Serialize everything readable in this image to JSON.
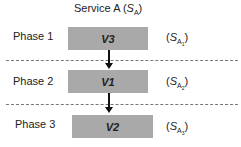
{
  "title": {
    "prefix": "Service A (",
    "symbol": "S",
    "sub": "A",
    "suffix": ")"
  },
  "phases": [
    {
      "label": "Phase 1",
      "version": "V3",
      "state": {
        "symbol": "S",
        "sub": "A",
        "subsub": "1"
      }
    },
    {
      "label": "Phase 2",
      "version": "V1",
      "state": {
        "symbol": "S",
        "sub": "A",
        "subsub": "2"
      }
    },
    {
      "label": "Phase 3",
      "version": "V2",
      "state": {
        "symbol": "S",
        "sub": "A",
        "subsub": "3"
      }
    }
  ],
  "colors": {
    "box": "#a9a9a9",
    "arrow": "#111111",
    "divider": "#777777"
  }
}
